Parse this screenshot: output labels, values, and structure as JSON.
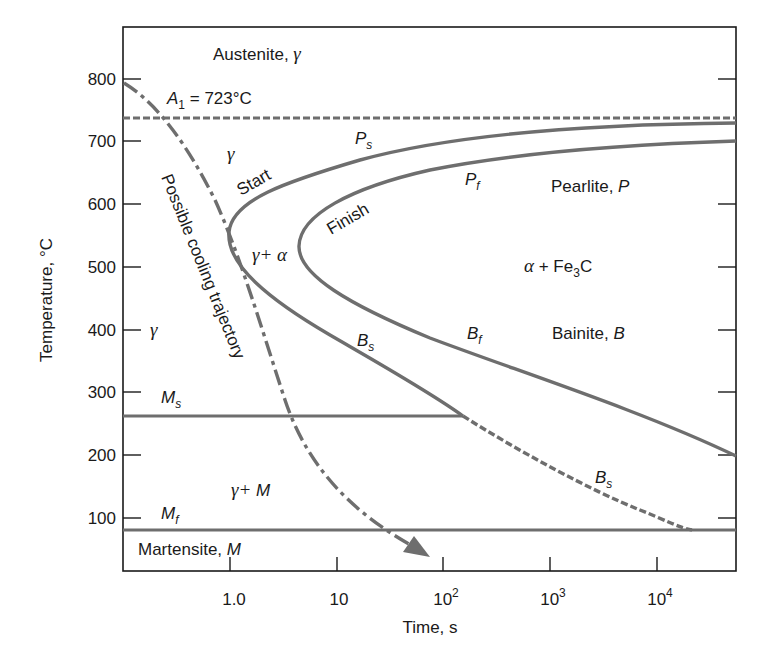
{
  "figure": {
    "type": "TTT diagram (isothermal transformation) for eutectoid steel",
    "colors": {
      "frame": "#1a1a1a",
      "curve": "#6e6e6e",
      "text": "#1a1a1a",
      "background": "#ffffff"
    }
  },
  "axes": {
    "y_title": "Temperature, °C",
    "x_title": "Time, s",
    "y_ticks": [
      "800",
      "700",
      "600",
      "500",
      "400",
      "300",
      "200",
      "100"
    ],
    "x_ticks": [
      {
        "base": "1.0",
        "exp": ""
      },
      {
        "base": "10",
        "exp": ""
      },
      {
        "base": "10",
        "exp": "2"
      },
      {
        "base": "10",
        "exp": "3"
      },
      {
        "base": "10",
        "exp": "4"
      }
    ]
  },
  "labels": {
    "austenite": "Austenite, ",
    "austenite_sym": "γ",
    "a1_sym": "A",
    "a1_sub": "1",
    "a1_value": " = 723°C",
    "gamma_upper": "γ",
    "start": "Start",
    "finish": "Finish",
    "ps": "P",
    "ps_sub": "s",
    "pf": "P",
    "pf_sub": "f",
    "pearlite": "Pearlite, ",
    "pearlite_sym": "P",
    "gamma_alpha": "γ+ α",
    "alpha_fe3c_a": "α",
    "alpha_fe3c_b": " + Fe",
    "alpha_fe3c_sub": "3",
    "alpha_fe3c_c": "C",
    "cooling": "Possible cooling trajectory",
    "gamma_left": "γ",
    "bs": "B",
    "bs_sub": "s",
    "bf": "B",
    "bf_sub": "f",
    "bainite": "Bainite, ",
    "bainite_sym": "B",
    "ms": "M",
    "ms_sub": "s",
    "bs_lower": "B",
    "bs_lower_sub": "s",
    "gamma_m": "γ+ ",
    "gamma_m_sym": "M",
    "mf": "M",
    "mf_sub": "f",
    "martensite": "Martensite, ",
    "martensite_sym": "M"
  },
  "reference_lines": {
    "A1_celsius": 723,
    "Ms_celsius": 262,
    "Mf_celsius": 82
  }
}
